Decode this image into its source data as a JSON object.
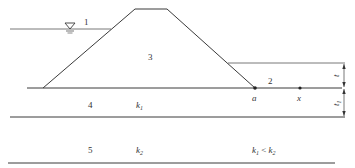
{
  "diagram": {
    "type": "earth-dam-seepage-cross-section",
    "regions": {
      "upstream_water": "1",
      "downstream": "2",
      "dam_body": "3",
      "upper_foundation_layer": "4",
      "lower_foundation_layer": "5"
    },
    "permeability": {
      "layer4": "k",
      "layer4_sub": "1",
      "layer5": "k",
      "layer5_sub": "2"
    },
    "relation": {
      "left": "k",
      "left_sub": "1",
      "op": " < ",
      "right": "k",
      "right_sub": "2"
    },
    "points": {
      "toe": "a",
      "distance": "x"
    },
    "dimensions": {
      "upper": "t",
      "lower": "t",
      "lower_sub": "1"
    },
    "water_level_symbol": "▽",
    "colors": {
      "line": "#3a3a3a",
      "text": "#333333",
      "background": "#ffffff"
    }
  }
}
